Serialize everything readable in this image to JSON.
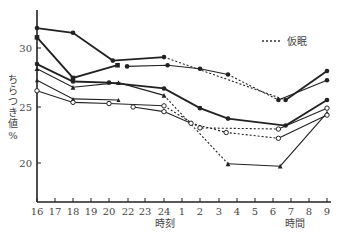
{
  "chart_data": {
    "type": "line",
    "title": "",
    "xlabel": "時刻",
    "xlabel_secondary": "時間",
    "ylabel": "ちらつき値 %",
    "ylim": [
      16.5,
      33
    ],
    "yticks": [
      20,
      25,
      30
    ],
    "x_ticks": [
      "16",
      "17",
      "18",
      "19",
      "20",
      "22",
      "23",
      "24",
      "1",
      "2",
      "3",
      "4",
      "5",
      "6",
      "7",
      "8",
      "9"
    ],
    "legend": [
      {
        "style": "dashed",
        "label": "仮眠"
      }
    ],
    "grid": false,
    "series": [
      {
        "name": "s1",
        "marker": "filled-circle",
        "weight": "bold",
        "points": [
          [
            "16",
            31.8
          ],
          [
            "18",
            31.4
          ],
          [
            "20.4",
            29.0
          ],
          [
            "24",
            29.3
          ]
        ],
        "dashed_segments": [
          [
            [
              "24",
              29.3
            ],
            [
              "6.7",
              25.6
            ]
          ]
        ],
        "continuation": [
          [
            "6.7",
            25.6
          ],
          [
            "9",
            28.1
          ]
        ]
      },
      {
        "name": "s2",
        "marker": "filled-square",
        "weight": "bold",
        "points": [
          [
            "16",
            31.0
          ],
          [
            "18",
            27.5
          ],
          [
            "20.9",
            28.6
          ]
        ]
      },
      {
        "name": "s3",
        "marker": "filled-circle",
        "weight": "normal",
        "points": [
          [
            "21.9",
            28.5
          ],
          [
            "24.2",
            28.6
          ],
          [
            "2",
            28.3
          ],
          [
            "3.5",
            27.8
          ]
        ],
        "dashed_segments": [
          [
            [
              "3.5",
              27.8
            ],
            [
              "6.3",
              25.6
            ]
          ]
        ],
        "continuation": [
          [
            "6.3",
            25.6
          ],
          [
            "9",
            27.3
          ]
        ]
      },
      {
        "name": "s4",
        "marker": "filled-circle",
        "weight": "bold",
        "points": [
          [
            "16",
            28.7
          ],
          [
            "18",
            27.2
          ],
          [
            "20",
            27.1
          ],
          [
            "24",
            26.6
          ],
          [
            "2",
            24.9
          ],
          [
            "3.5",
            24.0
          ],
          [
            "6.7",
            23.4
          ],
          [
            "9",
            25.6
          ]
        ]
      },
      {
        "name": "s5",
        "marker": "filled-triangle",
        "weight": "normal",
        "points": [
          [
            "16",
            28.3
          ],
          [
            "18",
            26.7
          ],
          [
            "21",
            27.1
          ],
          [
            "24",
            26.0
          ]
        ],
        "dashed_segments": [
          [
            [
              "24",
              26.0
            ],
            [
              "3.5",
              20.1
            ]
          ]
        ],
        "continuation": [
          [
            "3.5",
            20.1
          ],
          [
            "6.4",
            19.9
          ],
          [
            "9",
            24.5
          ]
        ]
      },
      {
        "name": "s6",
        "marker": "filled-triangle-small",
        "weight": "normal",
        "points": [
          [
            "16",
            27.3
          ],
          [
            "18",
            25.7
          ],
          [
            "21",
            25.6
          ]
        ]
      },
      {
        "name": "s7",
        "marker": "open-circle",
        "weight": "normal",
        "points": [
          [
            "16",
            26.4
          ],
          [
            "18",
            25.4
          ],
          [
            "20",
            25.3
          ],
          [
            "24",
            25.1
          ]
        ],
        "dashed_segments": [
          [
            [
              "24",
              25.1
            ],
            [
              "2",
              23.2
            ],
            [
              "6.3",
              23.1
            ]
          ]
        ],
        "continuation": [
          [
            "6.3",
            23.1
          ],
          [
            "9",
            24.9
          ]
        ]
      },
      {
        "name": "s8",
        "marker": "open-circle",
        "weight": "normal",
        "points": [
          [
            "22.3",
            25.0
          ],
          [
            "24",
            24.6
          ],
          [
            "1.5",
            23.6
          ]
        ],
        "dashed_segments": [
          [
            [
              "1.5",
              23.6
            ],
            [
              "3.4",
              22.8
            ],
            [
              "6.3",
              22.3
            ]
          ]
        ],
        "continuation": [
          [
            "6.3",
            22.3
          ],
          [
            "9",
            24.3
          ]
        ]
      }
    ]
  },
  "labels": {
    "y_axis_title": "ちらつき値",
    "y_axis_unit": "%",
    "x_axis_title_left": "時刻",
    "x_axis_title_right": "時間",
    "legend_label": "仮眠",
    "y_tick_labels": [
      "30",
      "25",
      "20"
    ],
    "x_tick_labels": [
      "16",
      "17",
      "18",
      "19",
      "20",
      "22",
      "23",
      "24",
      "1",
      "2",
      "3",
      "4",
      "5",
      "6",
      "7",
      "8",
      "9"
    ]
  }
}
